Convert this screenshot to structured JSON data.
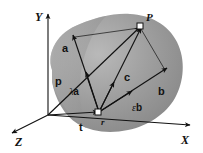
{
  "figure": {
    "background_color": "#ffffff",
    "surface_color": "#9a9a9a",
    "surface_highlight_color": "#c9c9c9",
    "surface_shadow_color": "#7e7e7e",
    "stroke_color": "#111111"
  },
  "axes": {
    "y": {
      "label": "Y"
    },
    "x": {
      "label": "X"
    },
    "z": {
      "label": "Z"
    }
  },
  "points": [
    {
      "name": "P",
      "label": "P",
      "marker": "open-square"
    },
    {
      "name": "T",
      "label": "r",
      "marker": "open-square"
    }
  ],
  "vectors": [
    {
      "name": "a",
      "label": "a",
      "style": "bold"
    },
    {
      "name": "b",
      "label": "b",
      "style": "bold"
    },
    {
      "name": "c",
      "label": "c",
      "style": "bold"
    },
    {
      "name": "p",
      "label": "p",
      "style": "bold"
    },
    {
      "name": "t",
      "label": "t",
      "style": "bold"
    }
  ],
  "scaled_vectors": [
    {
      "name": "lambda-a",
      "scalar": "λ",
      "vector": "a"
    },
    {
      "name": "epsilon-b",
      "scalar": "ε",
      "vector": "b"
    }
  ],
  "labels": {
    "y_axis": "Y",
    "x_axis": "X",
    "z_axis": "Z",
    "point_p": "P",
    "point_r": "r",
    "vec_a": "a",
    "vec_b": "b",
    "vec_c": "c",
    "vec_p": "p",
    "vec_t": "t",
    "lambda": "λ",
    "lambda_vec": "a",
    "epsilon": "ε",
    "epsilon_vec": "b"
  }
}
